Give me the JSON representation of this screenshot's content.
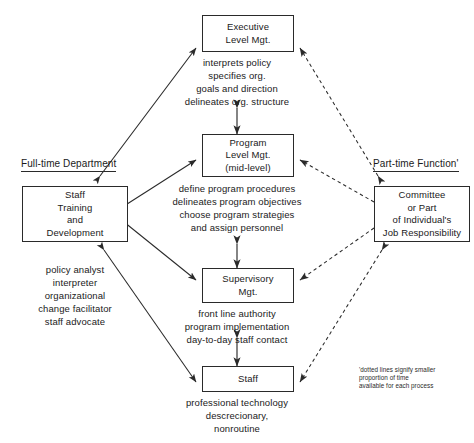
{
  "diagram": {
    "nodes": {
      "executive": {
        "lines": [
          "Executive",
          "Level Mgt."
        ]
      },
      "program": {
        "lines": [
          "Program",
          "Level Mgt.",
          "(mid-level)"
        ]
      },
      "supervisory": {
        "lines": [
          "Supervisory",
          "Mgt."
        ]
      },
      "staff": {
        "lines": [
          "Staff"
        ]
      },
      "staff_training": {
        "lines": [
          "Staff",
          "Training",
          "and",
          "Development"
        ]
      },
      "committee": {
        "lines": [
          "Committee",
          "or Part",
          "of Individual's",
          "Job Responsibility"
        ]
      }
    },
    "descriptions": {
      "executive": {
        "lines": [
          "interprets policy",
          "specifies org.",
          "goals and direction",
          "delineates org. structure"
        ]
      },
      "program": {
        "lines": [
          "define program procedures",
          "delineates program objectives",
          "choose program strategies",
          "and assign personnel"
        ]
      },
      "supervisory": {
        "lines": [
          "front line authority",
          "program implementation",
          "day-to-day staff contact"
        ]
      },
      "staff": {
        "lines": [
          "professional technology",
          "descrecionary,",
          "nonroutine"
        ]
      },
      "staff_training": {
        "lines": [
          "policy analyst",
          "interpreter",
          "organizational",
          "change facilitator",
          "staff advocate"
        ]
      }
    },
    "labels": {
      "left": "Full-time Department",
      "right": "Part-time Function'"
    },
    "footnote": {
      "lines": [
        "'dotted lines signify smaller",
        "proportion of time",
        "available for each process"
      ]
    },
    "colors": {
      "line": "#2a2a2a",
      "text": "#1a1a1a",
      "background": "#ffffff"
    }
  }
}
